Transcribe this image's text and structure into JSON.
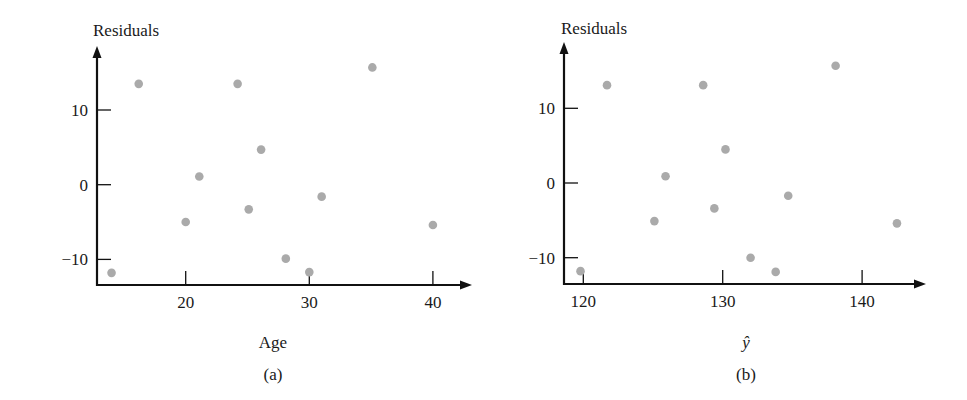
{
  "chart_data": [
    {
      "type": "scatter",
      "panel": "(a)",
      "title": "",
      "xlabel": "Age",
      "ylabel": "Residuals",
      "caption": "(a)",
      "x_ticks": [
        20,
        30,
        40
      ],
      "y_ticks": [
        10,
        0,
        -10
      ],
      "xlim": [
        13.2,
        42.5
      ],
      "ylim": [
        -13.5,
        18.5
      ],
      "grid": false,
      "legend": null,
      "marker_color": "#aaaaaa",
      "points": [
        {
          "x": 14.0,
          "y": -11.8
        },
        {
          "x": 16.2,
          "y": 13.5
        },
        {
          "x": 20.0,
          "y": -5.0
        },
        {
          "x": 21.1,
          "y": 1.1
        },
        {
          "x": 24.2,
          "y": 13.5
        },
        {
          "x": 25.1,
          "y": -3.3
        },
        {
          "x": 26.1,
          "y": 4.7
        },
        {
          "x": 28.1,
          "y": -9.9
        },
        {
          "x": 30.0,
          "y": -11.7
        },
        {
          "x": 31.0,
          "y": -1.6
        },
        {
          "x": 35.1,
          "y": 15.7
        },
        {
          "x": 40.0,
          "y": -5.4
        }
      ]
    },
    {
      "type": "scatter",
      "panel": "(b)",
      "title": "",
      "xlabel": "ŷ",
      "ylabel": "Residuals",
      "caption": "(b)",
      "x_ticks": [
        120,
        130,
        140
      ],
      "y_ticks": [
        10,
        0,
        -10
      ],
      "xlim": [
        118.6,
        145.2
      ],
      "ylim": [
        -13.5,
        18.5
      ],
      "grid": false,
      "legend": null,
      "marker_color": "#aaaaaa",
      "points": [
        {
          "x": 119.8,
          "y": -11.8
        },
        {
          "x": 121.7,
          "y": 13.1
        },
        {
          "x": 125.1,
          "y": -5.1
        },
        {
          "x": 125.9,
          "y": 0.9
        },
        {
          "x": 128.6,
          "y": 13.1
        },
        {
          "x": 129.4,
          "y": -3.4
        },
        {
          "x": 130.2,
          "y": 4.5
        },
        {
          "x": 132.0,
          "y": -10.0
        },
        {
          "x": 133.8,
          "y": -11.9
        },
        {
          "x": 134.7,
          "y": -1.7
        },
        {
          "x": 138.1,
          "y": 15.7
        },
        {
          "x": 142.5,
          "y": -5.4
        }
      ]
    }
  ],
  "layout": {
    "panels": [
      {
        "axis_x": 97,
        "axis_bottom": 285,
        "axis_top": 46,
        "axis_right": 472,
        "x_px_at": [
          [
            20,
            185.7
          ],
          [
            30,
            309.3
          ]
        ],
        "y_px_at": [
          [
            10,
            110
          ],
          [
            0,
            184.7
          ]
        ],
        "ylabel_pos": [
          93,
          36
        ],
        "xlabel_pos": [
          273,
          348
        ],
        "caption_pos": [
          273,
          380
        ]
      },
      {
        "axis_x": 564,
        "axis_bottom": 284,
        "axis_top": 42,
        "axis_right": 926,
        "x_px_at": [
          [
            120,
            583.3
          ],
          [
            130,
            722.7
          ]
        ],
        "y_px_at": [
          [
            10,
            108.3
          ],
          [
            0,
            183
          ]
        ],
        "ylabel_pos": [
          561,
          34
        ],
        "xlabel_pos": [
          746,
          348
        ],
        "caption_pos": [
          746,
          380
        ]
      }
    ]
  }
}
